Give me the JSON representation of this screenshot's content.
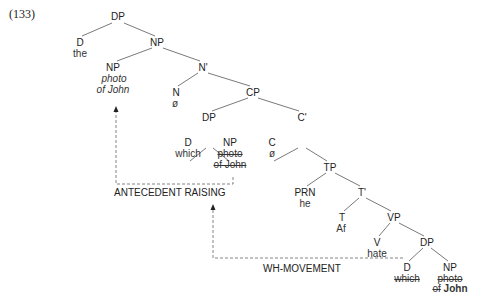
{
  "example_number": "(133)",
  "nodes": {
    "dp_root": "DP",
    "d_the": "D",
    "the": "the",
    "np_1": "NP",
    "np_antecedent": "NP",
    "np_antecedent_line1": "photo",
    "np_antecedent_line2": "of John",
    "n_bar": "N'",
    "n": "N",
    "n_null": "ø",
    "cp": "CP",
    "dp_spec": "DP",
    "d_which_spec": "D",
    "which_spec": "which",
    "np_spec": "NP",
    "np_spec_line1": "photo",
    "np_spec_line2": "of John",
    "c_bar": "C'",
    "c": "C",
    "c_null": "ø",
    "tp": "TP",
    "prn": "PRN",
    "he": "he",
    "t_bar": "T'",
    "t": "T",
    "af": "Af",
    "vp": "VP",
    "v": "V",
    "hate": "hate",
    "dp_obj": "DP",
    "d_which_obj": "D",
    "which_obj": "which",
    "np_obj": "NP",
    "np_obj_line1": "photo",
    "np_obj_line2_prefix": "of",
    "np_obj_line2_bold": "John"
  },
  "arrows": {
    "antecedent_raising": "ANTECEDENT RAISING",
    "wh_movement": "WH-MOVEMENT"
  },
  "colors": {
    "line": "#666666",
    "dashed": "#777777",
    "text": "#222222"
  }
}
